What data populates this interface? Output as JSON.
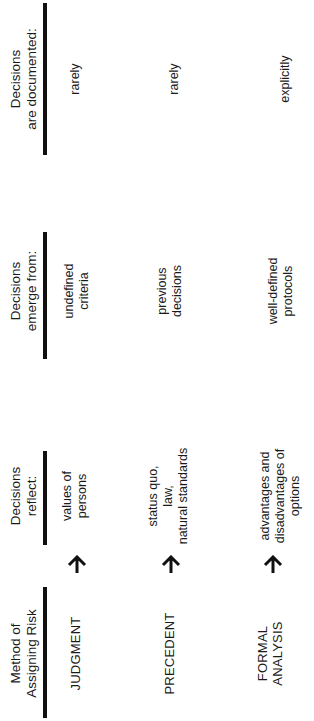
{
  "columns": [
    {
      "header": [
        "Method of",
        "Assigning Risk"
      ],
      "cells": [
        [
          "JUDGMENT"
        ],
        [
          "PRECEDENT"
        ],
        [
          "FORMAL",
          "ANALYSIS"
        ]
      ]
    },
    {
      "header": [
        "Decisions",
        "reflect:"
      ],
      "cells": [
        [
          "values of",
          "persons"
        ],
        [
          "status quo,",
          "law,",
          "natural standards"
        ],
        [
          "advantages and",
          "disadvantages of",
          "options"
        ]
      ]
    },
    {
      "header": [
        "Decisions",
        "emerge from:"
      ],
      "cells": [
        [
          "undefined",
          "criteria"
        ],
        [
          "previous",
          "decisions"
        ],
        [
          "well-defined",
          "protocols"
        ]
      ]
    },
    {
      "header": [
        "Decisions",
        "are documented:"
      ],
      "cells": [
        [
          "rarely"
        ],
        [
          "rarely"
        ],
        [
          "explicitly"
        ]
      ]
    }
  ],
  "arrows": [
    "arrow-right-icon",
    "arrow-right-icon",
    "arrow-right-icon"
  ],
  "orientation": "rotated-90-ccw"
}
